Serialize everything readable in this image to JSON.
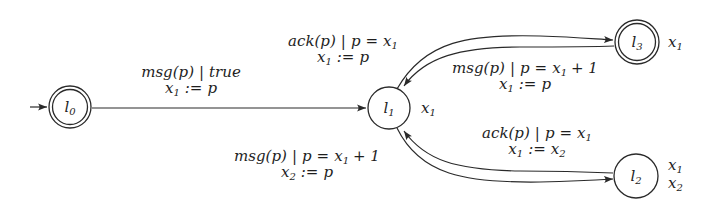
{
  "diagram": {
    "type": "automaton",
    "ambiguity_note": "Label-to-curve assignment for the l1<->l3 and l1<->l2 edge pairs is uncertain. The labels appear to sit on the opposite curves from the one their direction would suggest. The labels are reproduced at their visible positions, and the per-curve direction is recorded without a definitive label mapping.",
    "nodes": [
      {
        "id": "l0",
        "label": "l",
        "sub": "0",
        "accepting": true,
        "initial": true,
        "vars": []
      },
      {
        "id": "l1",
        "label": "l",
        "sub": "1",
        "accepting": false,
        "initial": false,
        "vars": [
          {
            "name": "x",
            "sub": "1"
          }
        ]
      },
      {
        "id": "l3",
        "label": "l",
        "sub": "3",
        "accepting": true,
        "initial": false,
        "vars": [
          {
            "name": "x",
            "sub": "1"
          }
        ]
      },
      {
        "id": "l2",
        "label": "l",
        "sub": "2",
        "accepting": false,
        "initial": false,
        "vars": [
          {
            "name": "x",
            "sub": "1"
          },
          {
            "name": "x",
            "sub": "2"
          }
        ]
      }
    ],
    "curves": [
      {
        "id": "c_l0_l1",
        "from": "l0",
        "to": "l1",
        "shape": "straight"
      },
      {
        "id": "c_upper_l1_l3",
        "from": "l1",
        "to": "l3",
        "shape": "outer-arc-top"
      },
      {
        "id": "c_lower_l3_l1",
        "from": "l3",
        "to": "l1",
        "shape": "inner-arc-top"
      },
      {
        "id": "c_upper_l2_l1",
        "from": "l2",
        "to": "l1",
        "shape": "inner-arc-bottom"
      },
      {
        "id": "c_lower_l1_l2",
        "from": "l1",
        "to": "l2",
        "shape": "outer-arc-bottom"
      }
    ],
    "labels": [
      {
        "id": "lbl_l0_l1",
        "near": "c_l0_l1",
        "guard_action": "msg",
        "guard_arg": "p",
        "guard_cond": "true",
        "assign_var": "x",
        "assign_sub": "1",
        "assign_rhs": "p"
      },
      {
        "id": "lbl_top_left",
        "near": "upper-left of l1-l3 curves",
        "guard_action": "ack",
        "guard_arg": "p",
        "guard_cond_lhs": "p",
        "guard_cond_rhs_var": "x",
        "guard_cond_rhs_sub": "1",
        "assign_var": "x",
        "assign_sub": "1",
        "assign_rhs": "p"
      },
      {
        "id": "lbl_top_right",
        "near": "below l1-l3 curves",
        "guard_action": "msg",
        "guard_arg": "p",
        "guard_cond_lhs": "p",
        "guard_cond_rhs_var": "x",
        "guard_cond_rhs_sub": "1",
        "guard_cond_rhs_plus": "+ 1",
        "assign_var": "x",
        "assign_sub": "1",
        "assign_rhs": "p"
      },
      {
        "id": "lbl_bottom_right",
        "near": "above l1-l2 curves",
        "guard_action": "ack",
        "guard_arg": "p",
        "guard_cond_lhs": "p",
        "guard_cond_rhs_var": "x",
        "guard_cond_rhs_sub": "1",
        "assign_var": "x",
        "assign_sub": "1",
        "assign_rhs_var": "x",
        "assign_rhs_sub": "2"
      },
      {
        "id": "lbl_bottom_left",
        "near": "left of l1-l2 curves",
        "guard_action": "msg",
        "guard_arg": "p",
        "guard_cond_lhs": "p",
        "guard_cond_rhs_var": "x",
        "guard_cond_rhs_sub": "1",
        "guard_cond_rhs_plus": "+ 1",
        "assign_var": "x",
        "assign_sub": "2",
        "assign_rhs": "p"
      }
    ],
    "symbols": {
      "bar": "|",
      "eq": "=",
      "assign": ":=",
      "lparen": "(",
      "rparen": ")"
    },
    "colors": {
      "stroke": "#2a2a2a",
      "text": "#1e1e1e",
      "background": "#ffffff"
    }
  }
}
